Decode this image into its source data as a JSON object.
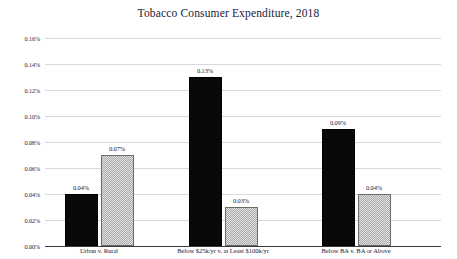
{
  "chart_data": {
    "type": "bar",
    "title": "Tobacco Consumer Expenditure, 2018",
    "xlabel": "",
    "ylabel": "",
    "ylim": [
      0,
      0.0016
    ],
    "grid": true,
    "legend": "none",
    "y_tick_labels": [
      "0.16%",
      "0.14%",
      "0.12%",
      "0.10%",
      "0.08%",
      "0.06%",
      "0.04%",
      "0.02%",
      "0.00%"
    ],
    "y_tick_values": [
      0.0016,
      0.0014,
      0.0012,
      0.001,
      0.0008,
      0.0006,
      0.0004,
      0.0002,
      0.0
    ],
    "categories": [
      "Urban v. Rural",
      "Below $25k/yr v. at Least $100k/yr",
      "Below BA v. BA or Above"
    ],
    "series": [
      {
        "name": "first-group-member",
        "style": "solid-black",
        "values": [
          0.0004,
          0.0013,
          0.0009
        ],
        "labels": [
          "0.04%",
          "0.13%",
          "0.09%"
        ]
      },
      {
        "name": "second-group-member",
        "style": "hatched-gray",
        "values": [
          0.0007,
          0.0003,
          0.0004
        ],
        "labels": [
          "0.07%",
          "0.03%",
          "0.04%"
        ]
      }
    ],
    "colors": {
      "dark_bar": "#090909",
      "light_bar": "#cfcfcf",
      "light_bar_border": "#6a6a6a",
      "gridline": "#d8d8dd",
      "axis": "#3a3a46",
      "text": "#16213a",
      "background": "#ffffff"
    }
  }
}
